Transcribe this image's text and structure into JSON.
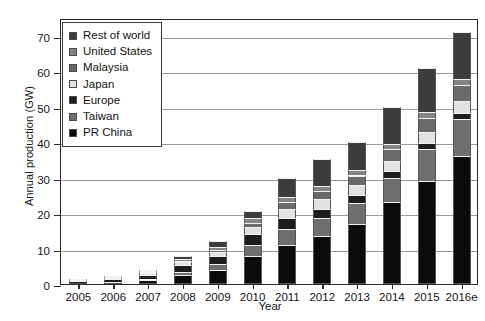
{
  "chart_data": {
    "type": "bar",
    "subtype": "stacked-bar",
    "title": "",
    "xlabel": "Year",
    "ylabel": "Annual production (GW)",
    "categories": [
      "2005",
      "2006",
      "2007",
      "2008",
      "2009",
      "2010",
      "2011",
      "2012",
      "2013",
      "2014",
      "2015",
      "2016e"
    ],
    "ylim": [
      0,
      75
    ],
    "yticks": [
      0,
      10,
      20,
      30,
      40,
      50,
      60,
      70
    ],
    "ytick_labels": [
      "0",
      "10",
      "20",
      "30",
      "40",
      "50",
      "60",
      "70"
    ],
    "grid": true,
    "grid_axis": "y",
    "legend_position": "upper-left",
    "stack_order_bottom_to_top": [
      "PR China",
      "Taiwan",
      "Europe",
      "Japan",
      "Malaysia",
      "United States",
      "Rest of world"
    ],
    "series": [
      {
        "name": "PR China",
        "color": "#0b0b0b",
        "values": [
          0.2,
          0.4,
          1.1,
          2.6,
          4.0,
          8.0,
          11.0,
          13.5,
          17.0,
          23.0,
          29.0,
          36.0
        ]
      },
      {
        "name": "Taiwan",
        "color": "#6f6f6f",
        "values": [
          0.1,
          0.2,
          0.4,
          0.8,
          1.6,
          3.0,
          4.4,
          5.0,
          5.8,
          7.0,
          9.0,
          10.5
        ]
      },
      {
        "name": "Europe",
        "color": "#1d1d1d",
        "values": [
          0.5,
          0.7,
          1.1,
          1.9,
          2.2,
          3.0,
          3.2,
          2.7,
          2.3,
          2.0,
          1.8,
          1.8
        ]
      },
      {
        "name": "Japan",
        "color": "#e2e2e2",
        "values": [
          0.3,
          0.4,
          0.6,
          0.9,
          1.3,
          2.2,
          2.6,
          2.7,
          2.8,
          2.8,
          3.0,
          3.2
        ]
      },
      {
        "name": "Malaysia",
        "color": "#6a6a6a",
        "values": [
          0.0,
          0.0,
          0.1,
          0.3,
          0.6,
          1.1,
          1.8,
          2.2,
          2.7,
          3.2,
          4.0,
          4.6
        ]
      },
      {
        "name": "United States",
        "color": "#848484",
        "values": [
          0.15,
          0.2,
          0.3,
          0.5,
          0.8,
          1.2,
          1.5,
          1.5,
          1.6,
          1.6,
          1.7,
          1.8
        ]
      },
      {
        "name": "Rest of world",
        "color": "#3c3c3c",
        "values": [
          0.25,
          0.3,
          0.4,
          1.0,
          1.5,
          2.0,
          5.3,
          7.6,
          7.8,
          10.4,
          12.5,
          13.1
        ]
      }
    ],
    "totals": [
      1.5,
      2.2,
      4.0,
      8.0,
      12.0,
      20.5,
      29.8,
      35.2,
      40.0,
      50.0,
      61.0,
      71.0
    ]
  },
  "legend": {
    "items": [
      {
        "label": "Rest of world",
        "color": "#3c3c3c"
      },
      {
        "label": "United States",
        "color": "#848484"
      },
      {
        "label": "Malaysia",
        "color": "#6a6a6a"
      },
      {
        "label": "Japan",
        "color": "#e2e2e2"
      },
      {
        "label": "Europe",
        "color": "#1d1d1d"
      },
      {
        "label": "Taiwan",
        "color": "#6f6f6f"
      },
      {
        "label": "PR China",
        "color": "#0b0b0b"
      }
    ]
  }
}
